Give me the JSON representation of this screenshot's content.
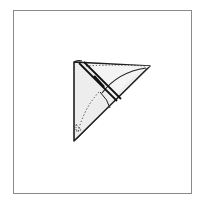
{
  "figure": {
    "type": "folding-diagram",
    "frame_color": "#8a8a8a",
    "paper_fill": "#ececec",
    "line_color": "#222222",
    "shapes": {
      "outer_triangle": "74,62 150,66 74,141",
      "band_line_a": "79,63 117,101",
      "band_line_b": "84,62 121,99",
      "dotted_top_edge": "M 86 66 Q 118 64 145 66",
      "dotted_fold_curve": "M 99 92 Q 84 108 78 132",
      "flap_curve": "M 102 93 Q 118 72 146 68",
      "inner_flap_curve": "M 100 92 Q 108 100 110 108",
      "triangle_mark": "76,124 81,130 76,131"
    }
  }
}
